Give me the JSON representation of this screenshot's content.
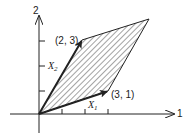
{
  "diagram": {
    "type": "parallelogram-spanned-by-vectors",
    "axes": {
      "horizontal_label": "1",
      "vertical_label": "2",
      "x_ticks": [
        1,
        2,
        3
      ],
      "y_ticks": [
        1,
        2,
        3
      ]
    },
    "vectors": [
      {
        "name": "X_1",
        "label_main": "X",
        "label_sub": "1",
        "end": [
          3,
          1
        ],
        "end_label": "(3, 1)"
      },
      {
        "name": "X_2",
        "label_main": "X",
        "label_sub": "2",
        "end": [
          2,
          3
        ],
        "end_label": "(2, 3)"
      }
    ],
    "parallelogram": {
      "vertices": [
        [
          0,
          0
        ],
        [
          3,
          1
        ],
        [
          5,
          4
        ],
        [
          2,
          3
        ]
      ],
      "fill": "hatched"
    },
    "colors": {
      "ink": "#222222",
      "background": "#ffffff"
    }
  }
}
